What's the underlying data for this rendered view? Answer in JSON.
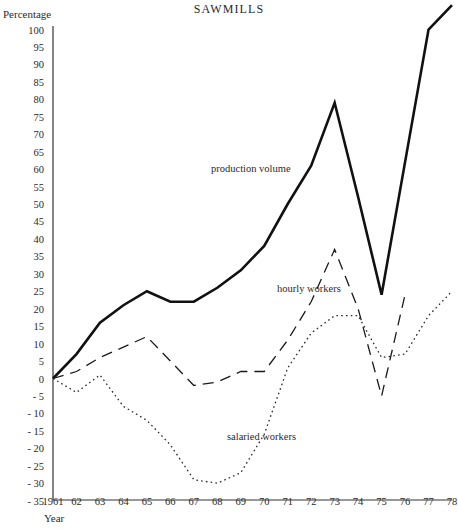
{
  "chart_data": {
    "type": "line",
    "title": "SAWMILLS",
    "xlabel": "Year",
    "ylabel": "Percentage",
    "x": [
      1961,
      1962,
      1963,
      1964,
      1965,
      1966,
      1967,
      1968,
      1969,
      1970,
      1971,
      1972,
      1973,
      1974,
      1975,
      1976,
      1977,
      1978
    ],
    "xtick_labels": [
      "1961",
      "62",
      "63",
      "64",
      "65",
      "66",
      "67",
      "68",
      "69",
      "70",
      "71",
      "72",
      "73",
      "74",
      "75",
      "76",
      "77",
      "78"
    ],
    "ytick_labels": [
      "100",
      "95",
      "90",
      "85",
      "80",
      "75",
      "70",
      "65",
      "60",
      "55",
      "50",
      "45",
      "40",
      "35",
      "30",
      "25",
      "20",
      "15",
      "10",
      "5",
      "0",
      "- 5",
      "- 10",
      "- 15",
      "- 20",
      "- 25",
      "- 30",
      "- 35"
    ],
    "ytick_values": [
      100,
      95,
      90,
      85,
      80,
      75,
      70,
      65,
      60,
      55,
      50,
      45,
      40,
      35,
      30,
      25,
      20,
      15,
      10,
      5,
      0,
      -5,
      -10,
      -15,
      -20,
      -25,
      -30,
      -35
    ],
    "ylim": [
      -35,
      105
    ],
    "xlim": [
      1961,
      1978
    ],
    "grid": false,
    "legend": "inline-annotations",
    "series": [
      {
        "name": "production volume",
        "style": "solid",
        "color": "#111111",
        "x": [
          1961,
          1962,
          1963,
          1964,
          1965,
          1966,
          1967,
          1968,
          1969,
          1970,
          1971,
          1972,
          1973,
          1974,
          1975,
          1976,
          1977,
          1978
        ],
        "values": [
          0,
          7,
          16,
          21,
          25,
          22,
          22,
          26,
          31,
          38,
          50,
          61,
          79,
          52,
          24,
          62,
          100,
          107
        ]
      },
      {
        "name": "hourly workers",
        "style": "dashed",
        "color": "#1a1a1a",
        "x": [
          1961,
          1962,
          1963,
          1964,
          1965,
          1966,
          1967,
          1968,
          1969,
          1970,
          1971,
          1972,
          1973,
          1974,
          1975,
          1976
        ],
        "values": [
          0,
          2,
          6,
          9,
          12,
          5,
          -2,
          -1,
          2,
          2,
          11,
          22,
          37,
          20,
          -5,
          24
        ]
      },
      {
        "name": "salaried workers",
        "style": "dotted",
        "color": "#2a2a2a",
        "x": [
          1961,
          1962,
          1963,
          1964,
          1965,
          1966,
          1967,
          1968,
          1969,
          1970,
          1971,
          1972,
          1973,
          1974,
          1975,
          1976,
          1977,
          1978
        ],
        "values": [
          0,
          -4,
          1,
          -8,
          -12,
          -19,
          -29,
          -30,
          -27,
          -16,
          3,
          13,
          18,
          18,
          6,
          7,
          18,
          25
        ]
      }
    ],
    "annotations": [
      {
        "text": "production volume",
        "x_px": 211,
        "y_px": 163
      },
      {
        "text": "hourly workers",
        "x_px": 277,
        "y_px": 283
      },
      {
        "text": "salaried workers",
        "x_px": 227,
        "y_px": 431
      }
    ]
  }
}
